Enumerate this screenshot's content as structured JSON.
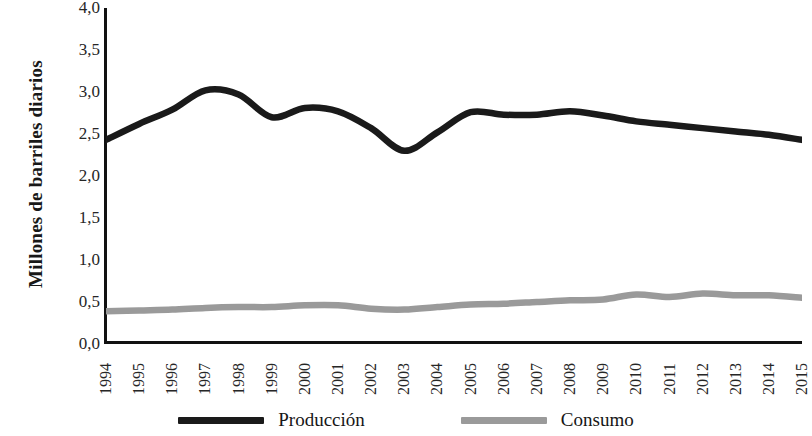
{
  "chart_data": {
    "type": "line",
    "title": "",
    "subtitle": "",
    "xlabel": "",
    "ylabel": "Millones de barriles diarios",
    "x": [
      1994,
      1995,
      1996,
      1997,
      1998,
      1999,
      2000,
      2001,
      2002,
      2003,
      2004,
      2005,
      2006,
      2007,
      2008,
      2009,
      2010,
      2011,
      2012,
      2013,
      2014,
      2015
    ],
    "categories": [
      "1994",
      "1995",
      "1996",
      "1997",
      "1998",
      "1999",
      "2000",
      "2001",
      "2002",
      "2003",
      "2004",
      "2005",
      "2006",
      "2007",
      "2008",
      "2009",
      "2010",
      "2011",
      "2012",
      "2013",
      "2014",
      "2015"
    ],
    "series": [
      {
        "name": "Producción",
        "color": "#1a1a1a",
        "values": [
          2.43,
          2.62,
          2.79,
          3.02,
          2.97,
          2.7,
          2.81,
          2.77,
          2.57,
          2.3,
          2.52,
          2.76,
          2.73,
          2.73,
          2.77,
          2.72,
          2.65,
          2.61,
          2.57,
          2.53,
          2.49,
          2.43
        ]
      },
      {
        "name": "Consumo",
        "color": "#9a9a9a",
        "values": [
          0.39,
          0.4,
          0.41,
          0.43,
          0.44,
          0.44,
          0.46,
          0.46,
          0.42,
          0.41,
          0.44,
          0.47,
          0.48,
          0.5,
          0.52,
          0.53,
          0.59,
          0.56,
          0.6,
          0.58,
          0.58,
          0.55
        ]
      }
    ],
    "ylim": [
      0.0,
      4.0
    ],
    "ytick_values": [
      0.0,
      0.5,
      1.0,
      1.5,
      2.0,
      2.5,
      3.0,
      3.5,
      4.0
    ],
    "ytick_labels": [
      "0,0",
      "0,5",
      "1,0",
      "1,5",
      "2,0",
      "2,5",
      "3,0",
      "3,5",
      "4,0"
    ],
    "xlim": [
      1994,
      2015
    ],
    "grid": false,
    "legend_position": "bottom",
    "decimal_separator": ","
  },
  "legend": {
    "items": [
      {
        "label": "Producción",
        "color": "#1a1a1a"
      },
      {
        "label": "Consumo",
        "color": "#9a9a9a"
      }
    ]
  }
}
